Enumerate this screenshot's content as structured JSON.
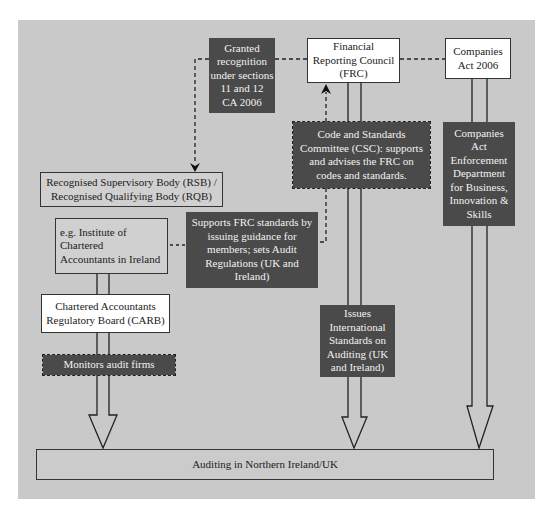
{
  "diagram": {
    "title": "",
    "colors": {
      "panel_background": "#c9c9c9",
      "dark_box": "#4a4a4a",
      "dark_box_text": "#f2f2f2",
      "light_box": "#ffffff",
      "border": "#333333"
    },
    "nodes": {
      "granted_recognition": {
        "label": "Granted\nrecognition\nunder sections\n11 and 12\nCA 2006",
        "style": "dark"
      },
      "frc": {
        "label": "Financial\nReporting Council\n(FRC)",
        "style": "light"
      },
      "companies_act": {
        "label": "Companies\nAct 2006",
        "style": "light"
      },
      "csc": {
        "label": "Code and Standards\nCommittee (CSC): supports\nand advises the FRC on\ncodes and standards.",
        "style": "dark-dashed"
      },
      "enforcement_dept": {
        "label": "Companies\nAct\nEnforcement\nDepartment\nfor Business,\nInnovation &\nSkills",
        "style": "dark"
      },
      "rsb_rqb": {
        "label": "Recognised Supervisory Body (RSB) /\nRecognised Qualifying Body (RQB)",
        "style": "grey"
      },
      "institute": {
        "label": "e.g. Institute of\nChartered\nAccountants in Ireland",
        "style": "grey"
      },
      "supports_frc": {
        "label": "Supports FRC standards by\nissuing guidance for\nmembers; sets Audit\nRegulations (UK and\nIreland)",
        "style": "dark"
      },
      "carb": {
        "label": "Chartered Accountants\nRegulatory Board (CARB)",
        "style": "light"
      },
      "monitors": {
        "label": "Monitors audit firms",
        "style": "dark-dashed"
      },
      "issues_isa": {
        "label": "Issues\nInternational\nStandards on\nAuditing (UK\nand Ireland)",
        "style": "dark"
      },
      "auditing_ni_uk": {
        "label": "Auditing in Northern Ireland/UK",
        "style": "grey"
      }
    },
    "edges": [
      {
        "from": "frc",
        "to": "granted_recognition",
        "type": "dashed"
      },
      {
        "from": "granted_recognition",
        "to": "rsb_rqb",
        "type": "dashed-arrow"
      },
      {
        "from": "frc",
        "to": "companies_act",
        "type": "dashed"
      },
      {
        "from": "csc",
        "to": "frc",
        "type": "dashed-arrow"
      },
      {
        "from": "supports_frc",
        "to": "csc",
        "type": "dashed"
      },
      {
        "from": "institute",
        "to": "supports_frc",
        "type": "dashed"
      },
      {
        "from": "institute",
        "to": "carb",
        "type": "double-line"
      },
      {
        "from": "carb",
        "to": "auditing_ni_uk",
        "type": "hollow-arrow",
        "via": "monitors"
      },
      {
        "from": "frc",
        "to": "auditing_ni_uk",
        "type": "hollow-arrow",
        "via": "issues_isa"
      },
      {
        "from": "companies_act",
        "to": "auditing_ni_uk",
        "type": "hollow-arrow",
        "via": "enforcement_dept"
      }
    ]
  }
}
